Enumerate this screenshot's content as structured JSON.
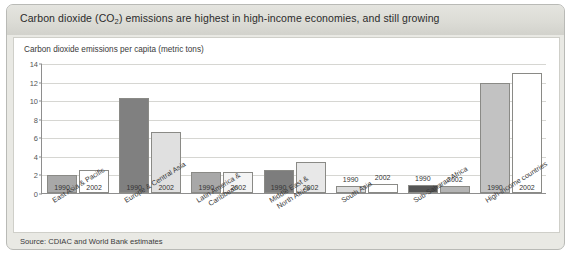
{
  "title": {
    "prefix": "Carbon dioxide (CO",
    "sub": "2",
    "suffix": ") emissions are highest in high-income economies, and still growing"
  },
  "subtitle": "Carbon dioxide emissions per capita (metric tons)",
  "source": "Source: CDIAC and World Bank estimates",
  "colors": {
    "panel_bg": "#e9e9e4",
    "card_bg": "#ffffff",
    "series_1990_default": "#9e9e9e",
    "series_2002_default": "#ffffff",
    "bar_border": "#8a8a86",
    "grid": "#d6d6d2",
    "axis": "#8e8e8e"
  },
  "chart_data": {
    "type": "bar",
    "title": "Carbon dioxide (CO2) emissions are highest in high-income economies, and still growing",
    "subtitle": "Carbon dioxide emissions per capita (metric tons)",
    "xlabel": "",
    "ylabel": "Carbon dioxide emissions per capita (metric tons)",
    "ylim": [
      0,
      14
    ],
    "yticks": [
      0,
      2,
      4,
      6,
      8,
      10,
      12,
      14
    ],
    "grid": true,
    "legend": "none",
    "bar_value_labels": [
      "1990",
      "2002"
    ],
    "categories": [
      "East Asia & Pacific",
      "Europe & Central Asia",
      "Latin America & Caribbean",
      "Middle East & North Africa",
      "South Asia",
      "Sub-Saharan Africa",
      "High-income countries"
    ],
    "category_lines": [
      [
        "East Asia & Pacific"
      ],
      [
        "Europe & Central Asia"
      ],
      [
        "Latin America &",
        "Caribbean"
      ],
      [
        "Middle East &",
        "North Africa"
      ],
      [
        "South Asia"
      ],
      [
        "Sub-Saharan Africa"
      ],
      [
        "High-income countries"
      ]
    ],
    "series": [
      {
        "name": "1990",
        "values": [
          1.9,
          10.2,
          2.3,
          2.5,
          0.8,
          0.9,
          11.9
        ],
        "fills": [
          "#a8a8a8",
          "#808080",
          "#a8a8a8",
          "#7d7d7d",
          "#dcdcdc",
          "#555555",
          "#c2c2c2"
        ]
      },
      {
        "name": "2002",
        "values": [
          2.5,
          6.6,
          2.3,
          3.3,
          1.0,
          0.8,
          12.9
        ],
        "fills": [
          "#ffffff",
          "#e0e0e0",
          "#f4f4f4",
          "#e8e8e8",
          "#ffffff",
          "#b4b4b4",
          "#ffffff"
        ]
      }
    ]
  }
}
